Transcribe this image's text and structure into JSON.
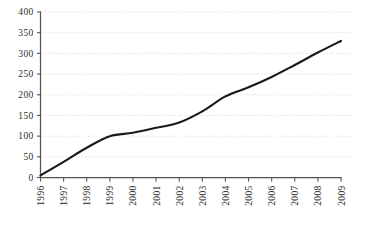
{
  "chart_data": {
    "type": "line",
    "title": "",
    "xlabel": "",
    "ylabel": "",
    "categories": [
      "1996",
      "1997",
      "1998",
      "1999",
      "2000",
      "2001",
      "2002",
      "2003",
      "2004",
      "2005",
      "2006",
      "2007",
      "2008",
      "2009"
    ],
    "x": [
      1996,
      1997,
      1998,
      1999,
      2000,
      2001,
      2002,
      2003,
      2004,
      2005,
      2006,
      2007,
      2008,
      2009
    ],
    "values": [
      5,
      38,
      72,
      100,
      108,
      120,
      133,
      160,
      196,
      218,
      243,
      272,
      302,
      330
    ],
    "ylim": [
      0,
      400
    ],
    "ytick_values": [
      0,
      50,
      100,
      150,
      200,
      250,
      300,
      350,
      400
    ],
    "ytick_labels": [
      "0",
      "50",
      "100",
      "150",
      "200",
      "250",
      "300",
      "350",
      "400"
    ],
    "grid": true,
    "grid_axis": "y",
    "legend": false,
    "legend_position": "none",
    "line_color": "#1a1a1a",
    "grid_color": "#c9c9c9",
    "axis_color": "#555555"
  },
  "caption": {
    "text": ""
  }
}
